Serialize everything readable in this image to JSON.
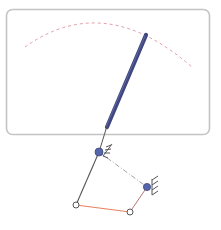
{
  "diagram": {
    "type": "four-bar-linkage-pointer",
    "colors": {
      "background": "#ffffff",
      "frame": "#c4c4c4",
      "arc": "#e29aa8",
      "needle": "#3f4680",
      "needle_highlight": "#6a70a8",
      "link": "#555555",
      "coupler": "#e8805e",
      "rocker_link": "#b07878",
      "dash_link": "#9a9a9a",
      "fixed_pivot": "#5566aa",
      "moving_joint_fill": "#ffffff",
      "moving_joint_stroke": "#555555",
      "hatch": "#555555"
    },
    "frame": {
      "x": 6,
      "y": 9,
      "width": 203,
      "height": 125,
      "radius": 6
    },
    "arc": {
      "start": [
        25,
        47
      ],
      "control": [
        105,
        -10
      ],
      "end": [
        193,
        68
      ]
    },
    "needle": {
      "tip": [
        146,
        35
      ],
      "base": [
        106,
        128
      ],
      "width": 4
    },
    "input_link": {
      "from": [
        106,
        128
      ],
      "to": [
        99,
        152
      ]
    },
    "fixed_pivots": [
      {
        "name": "pivot-a",
        "x": 99,
        "y": 152
      },
      {
        "name": "pivot-b",
        "x": 147,
        "y": 187
      }
    ],
    "moving_joints": [
      {
        "name": "joint-c",
        "x": 76,
        "y": 205
      },
      {
        "name": "joint-d",
        "x": 130,
        "y": 212
      }
    ],
    "links": {
      "crank": {
        "from": [
          99,
          152
        ],
        "to": [
          76,
          205
        ]
      },
      "coupler": {
        "from": [
          76,
          205
        ],
        "to": [
          130,
          212
        ]
      },
      "rocker": {
        "from": [
          130,
          212
        ],
        "to": [
          147,
          187
        ]
      },
      "ground": {
        "from": [
          99,
          152
        ],
        "to": [
          147,
          187
        ]
      }
    }
  }
}
